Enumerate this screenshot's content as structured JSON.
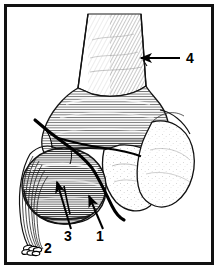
{
  "figure": {
    "kind": "anatomical line drawing",
    "frame_color": "#111111",
    "background_color": "#ffffff",
    "ink_color": "#000000",
    "shading_color": "#333333",
    "fracture_line_color": "#000000",
    "border": {
      "outer_margin_label": "white margin",
      "frame_thickness_px": 3
    }
  },
  "labels": [
    {
      "id": "label-1",
      "text": "1",
      "x": 100,
      "y": 241,
      "points_to": "fracture line / avulsed fragment edge",
      "arrow": {
        "tail_x": 103,
        "tail_y": 229,
        "head_x": 89,
        "head_y": 196
      }
    },
    {
      "id": "label-2",
      "text": "2",
      "x": 44,
      "y": 253,
      "points_to": "cut ends of flexor muscle fiber bundle",
      "arrow": null
    },
    {
      "id": "label-3",
      "text": "3",
      "x": 68,
      "y": 241,
      "points_to": "medial epicondyle",
      "arrow": {
        "tail_x": 71,
        "tail_y": 229,
        "head_x": 57,
        "head_y": 182
      }
    },
    {
      "id": "label-4",
      "text": "4",
      "x": 186,
      "y": 63,
      "points_to": "humeral shaft",
      "arrow": {
        "tail_x": 180,
        "tail_y": 58,
        "head_x": 141,
        "head_y": 58
      }
    }
  ],
  "structures": [
    {
      "id": "humeral-shaft",
      "name": "humeral shaft",
      "shading": "diagonal hatching"
    },
    {
      "id": "distal-metaphysis",
      "name": "distal metaphysis / supracondylar flare",
      "shading": "horizontal contour hatching"
    },
    {
      "id": "medial-epicondyle",
      "name": "medial epicondyle (avulsed)",
      "shading": "dense horizontal hatching"
    },
    {
      "id": "trochlea",
      "name": "trochlea",
      "shading": "stipple"
    },
    {
      "id": "capitellum",
      "name": "capitellum",
      "shading": "stipple"
    },
    {
      "id": "muscle-bundle",
      "name": "flexor muscle fiber bundle",
      "shading": "parallel fiber lines"
    },
    {
      "id": "fracture-line",
      "name": "fracture line",
      "shading": "thick solid stroke"
    }
  ]
}
